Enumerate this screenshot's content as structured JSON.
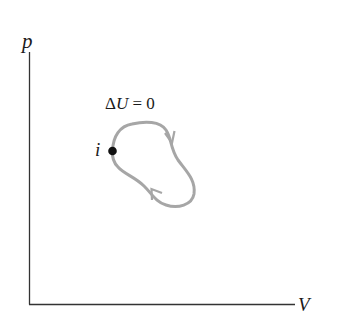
{
  "diagram": {
    "type": "pV-diagram",
    "axes": {
      "y_label": "p",
      "x_label": "V"
    },
    "annotation": {
      "delta": "Δ",
      "symbol": "U",
      "relation": " = 0"
    },
    "state_point": {
      "label": "i"
    },
    "cycle": {
      "direction": "clockwise",
      "arrows": 2,
      "color": "#a6a6a6"
    },
    "colors": {
      "axis": "#333333",
      "curve": "#a6a6a6",
      "point": "#111111",
      "text": "#1a1a1a"
    }
  }
}
